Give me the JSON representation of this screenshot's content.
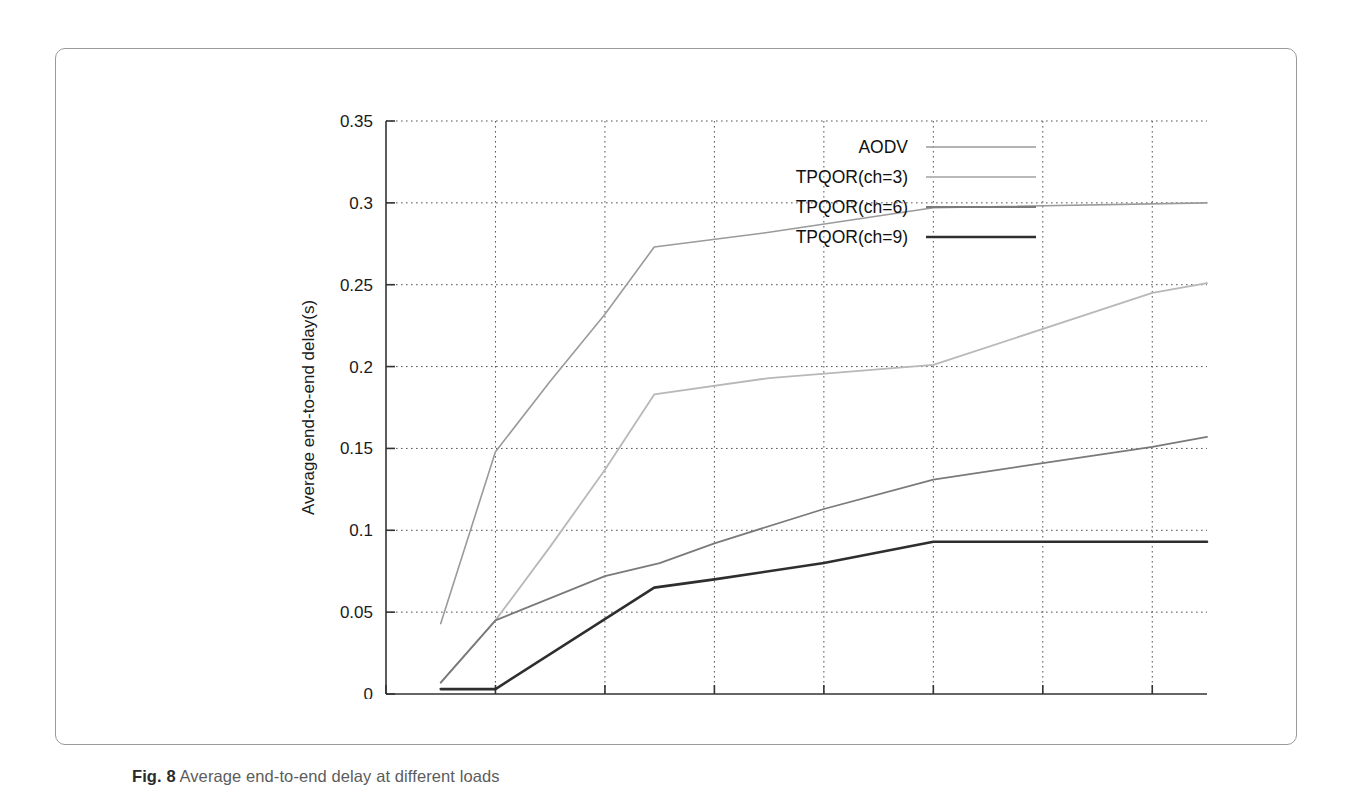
{
  "figure": {
    "caption_label": "Fig. 8",
    "caption_text": " Average end-to-end delay at different loads"
  },
  "chart_data": {
    "type": "line",
    "title": "",
    "xlabel": "CBR sending rate per flow(Kbps)",
    "ylabel": "Average end-to-end delay(s)",
    "xlim": [
      0,
      1500
    ],
    "ylim": [
      0,
      0.35
    ],
    "xticks": [
      0,
      200,
      400,
      600,
      800,
      1000,
      1200,
      1400
    ],
    "xtick_labels": [
      "0",
      "200",
      "400",
      "600",
      "800",
      "1000",
      "1200",
      "1400"
    ],
    "yticks": [
      0,
      0.05,
      0.1,
      0.15,
      0.2,
      0.25,
      0.3,
      0.35
    ],
    "ytick_labels": [
      "0",
      "0.05",
      "0.1",
      "0.15",
      "0.2",
      "0.25",
      "0.3",
      "0.35"
    ],
    "grid": true,
    "grid_style": "dotted",
    "legend_position": "top-center",
    "series": [
      {
        "name": "AODV",
        "color": "#9a9a9a",
        "width": 1.6,
        "x": [
          100,
          200,
          300,
          400,
          490,
          700,
          1000,
          1500
        ],
        "y": [
          0.043,
          0.148,
          0.191,
          0.232,
          0.273,
          0.282,
          0.297,
          0.3
        ]
      },
      {
        "name": "TPQOR(ch=3)",
        "color": "#b8b8b8",
        "width": 1.8,
        "x": [
          100,
          200,
          300,
          400,
          490,
          700,
          1000,
          1400,
          1500
        ],
        "y": [
          0.007,
          0.045,
          0.09,
          0.137,
          0.183,
          0.193,
          0.201,
          0.245,
          0.251
        ]
      },
      {
        "name": "TPQOR(ch=6)",
        "color": "#7a7a7a",
        "width": 1.8,
        "x": [
          100,
          200,
          400,
          500,
          600,
          800,
          1000,
          1200,
          1400,
          1500
        ],
        "y": [
          0.007,
          0.045,
          0.072,
          0.08,
          0.092,
          0.113,
          0.131,
          0.141,
          0.151,
          0.157
        ]
      },
      {
        "name": "TPQOR(ch=9)",
        "color": "#2e2e2e",
        "width": 2.6,
        "x": [
          100,
          200,
          490,
          600,
          800,
          1000,
          1200,
          1500
        ],
        "y": [
          0.003,
          0.003,
          0.065,
          0.07,
          0.08,
          0.093,
          0.093,
          0.093
        ]
      }
    ]
  }
}
